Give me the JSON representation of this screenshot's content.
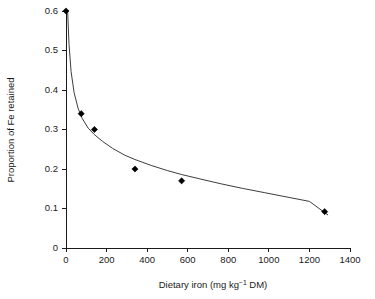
{
  "chart_data": {
    "type": "scatter",
    "title": "",
    "xlabel": "Dietary iron (mg kg⁻¹ DM)",
    "xlabel_parts": {
      "pre": "Dietary iron (mg kg",
      "sup": "−1",
      "post": " DM)"
    },
    "ylabel": "Proportion of Fe retained",
    "xlim": [
      0,
      1400
    ],
    "ylim": [
      0,
      0.6
    ],
    "xticks": [
      0,
      200,
      400,
      600,
      800,
      1000,
      1200,
      1400
    ],
    "xtick_labels": [
      "0",
      "200",
      "400",
      "600",
      "800",
      "1000",
      "1200",
      "1400"
    ],
    "yticks": [
      0,
      0.1,
      0.2,
      0.3,
      0.4,
      0.5,
      0.6
    ],
    "ytick_labels": [
      "0",
      "0.1",
      "0.2",
      "0.3",
      "0.4",
      "0.5",
      "0.6"
    ],
    "grid": false,
    "legend": false,
    "legend_position": "none",
    "marker_shape": "diamond",
    "marker_color": "#000000",
    "curve_color": "#3d3d3d",
    "background_color": "#ffffff",
    "axis_color": "#1a1a1a",
    "series": [
      {
        "name": "Observed Fe retention",
        "marker": "diamond",
        "points": [
          {
            "x": 0,
            "y": 0.6
          },
          {
            "x": 75,
            "y": 0.34
          },
          {
            "x": 140,
            "y": 0.3
          },
          {
            "x": 340,
            "y": 0.2
          },
          {
            "x": 570,
            "y": 0.17
          },
          {
            "x": 1275,
            "y": 0.092
          }
        ]
      },
      {
        "name": "Fitted decay curve",
        "type": "line",
        "curve_points": [
          {
            "x": 8,
            "y": 0.6
          },
          {
            "x": 15,
            "y": 0.515
          },
          {
            "x": 25,
            "y": 0.447
          },
          {
            "x": 40,
            "y": 0.393
          },
          {
            "x": 60,
            "y": 0.353
          },
          {
            "x": 80,
            "y": 0.328
          },
          {
            "x": 110,
            "y": 0.303
          },
          {
            "x": 140,
            "y": 0.287
          },
          {
            "x": 180,
            "y": 0.27
          },
          {
            "x": 230,
            "y": 0.252
          },
          {
            "x": 290,
            "y": 0.235
          },
          {
            "x": 340,
            "y": 0.224
          },
          {
            "x": 420,
            "y": 0.209
          },
          {
            "x": 500,
            "y": 0.196
          },
          {
            "x": 570,
            "y": 0.186
          },
          {
            "x": 660,
            "y": 0.175
          },
          {
            "x": 760,
            "y": 0.163
          },
          {
            "x": 870,
            "y": 0.151
          },
          {
            "x": 980,
            "y": 0.14
          },
          {
            "x": 1100,
            "y": 0.128
          },
          {
            "x": 1200,
            "y": 0.118
          },
          {
            "x": 1290,
            "y": 0.084
          }
        ]
      }
    ]
  },
  "axes": {
    "y_title": "Proportion of Fe retained",
    "x_title_pre": "Dietary iron (mg kg",
    "x_title_sup": "−1",
    "x_title_post": " DM)"
  }
}
